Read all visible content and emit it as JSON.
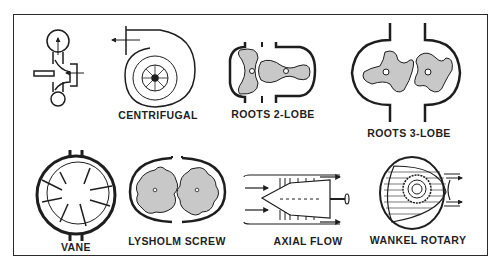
{
  "figure": {
    "colors": {
      "ink": "#1e1e1e",
      "rotor_fill": "#c8c8c8",
      "background": "#ffffff"
    },
    "labels": {
      "centrifugal": "CENTRIFUGAL",
      "roots_2_lobe": "ROOTS 2-LOBE",
      "roots_3_lobe": "ROOTS 3-LOBE",
      "vane": "VANE",
      "lysholm_screw": "LYSHOLM SCREW",
      "axial_flow": "AXIAL FLOW",
      "wankel_rotary": "WANKEL ROTARY"
    }
  }
}
